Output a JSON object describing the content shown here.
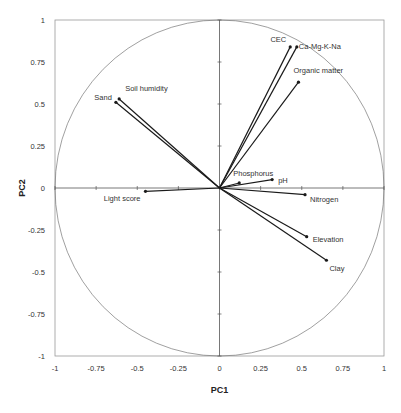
{
  "chart_data": {
    "type": "scatter",
    "subtype": "pca-correlation-circle",
    "title": "",
    "xlabel": "PC1",
    "ylabel": "PC2",
    "xlim": [
      -1,
      1
    ],
    "ylim": [
      -1,
      1
    ],
    "grid": false,
    "legend": null,
    "x_ticks": [
      "-1",
      "-0.75",
      "-0.5",
      "-0.25",
      "0",
      "0.25",
      "0.5",
      "0.75",
      "1"
    ],
    "y_ticks": [
      "1",
      "0.75",
      "0.5",
      "0.25",
      "0",
      "-0.25",
      "-0.5",
      "-0.75",
      "-1"
    ],
    "unit_circle": true,
    "vectors": [
      {
        "name": "Sand",
        "x": -0.63,
        "y": 0.51
      },
      {
        "name": "Soil humidity",
        "x": -0.61,
        "y": 0.53
      },
      {
        "name": "CEC",
        "x": 0.43,
        "y": 0.84
      },
      {
        "name": "Ca-Mg-K-Na",
        "x": 0.47,
        "y": 0.84
      },
      {
        "name": "Organic matter",
        "x": 0.48,
        "y": 0.63
      },
      {
        "name": "Phosphorus",
        "x": 0.12,
        "y": 0.03
      },
      {
        "name": "pH",
        "x": 0.32,
        "y": 0.05
      },
      {
        "name": "Light score",
        "x": -0.45,
        "y": -0.02
      },
      {
        "name": "Nitrogen",
        "x": 0.52,
        "y": -0.04
      },
      {
        "name": "Elevation",
        "x": 0.53,
        "y": -0.29
      },
      {
        "name": "Clay",
        "x": 0.65,
        "y": -0.43
      }
    ]
  }
}
